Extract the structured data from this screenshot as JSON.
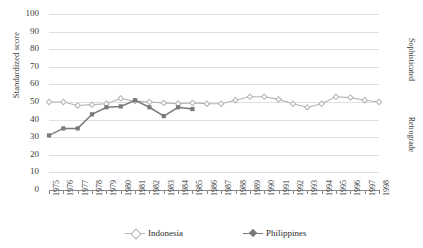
{
  "chart_data": {
    "type": "line",
    "title": "",
    "xlabel": "",
    "ylabel": "Standardized score",
    "ylim": [
      0,
      100
    ],
    "ytick_step": 10,
    "grid": true,
    "legend_position": "bottom",
    "right_axis_labels": {
      "top": "Sophisticated",
      "bottom": "Retrograde"
    },
    "categories": [
      "1975",
      "1976",
      "1977",
      "1978",
      "1979",
      "1980",
      "1981",
      "1982",
      "1983",
      "1984",
      "1985",
      "1986",
      "1987",
      "1988",
      "1989",
      "1990",
      "1991",
      "1992",
      "1993",
      "1994",
      "1995",
      "1996",
      "1997",
      "1998"
    ],
    "yticks": [
      "0",
      "10",
      "20",
      "30",
      "40",
      "50",
      "60",
      "70",
      "80",
      "90",
      "100"
    ],
    "series": [
      {
        "name": "Indonesia",
        "color": "#b3b3b3",
        "marker": "diamond",
        "values": [
          50,
          50,
          48,
          48.5,
          49,
          52,
          50.5,
          50,
          49.5,
          49,
          49.5,
          49,
          49,
          51,
          53,
          53,
          51.5,
          49,
          47,
          49,
          53,
          52.5,
          51,
          50
        ]
      },
      {
        "name": "Philippines",
        "color": "#7a7a7a",
        "marker": "square",
        "values": [
          31,
          35,
          35,
          43,
          47,
          47.5,
          51,
          47,
          42,
          47,
          46,
          null,
          null,
          null,
          null,
          null,
          null,
          null,
          null,
          null,
          null,
          null,
          null,
          null
        ]
      }
    ]
  },
  "legend": {
    "items": [
      {
        "label": "Indonesia",
        "color": "#b3b3b3"
      },
      {
        "label": "Philippines",
        "color": "#7a7a7a"
      }
    ]
  }
}
